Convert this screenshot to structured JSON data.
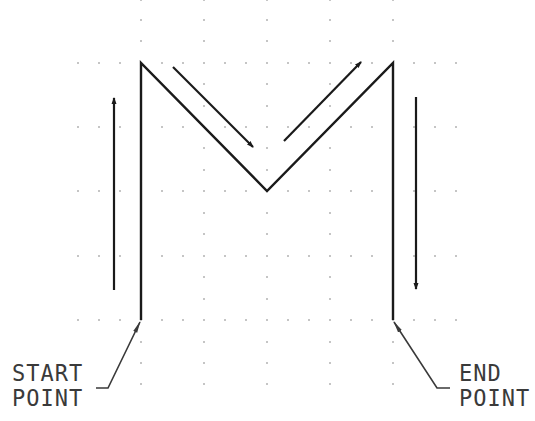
{
  "diagram": {
    "letter": "M",
    "colors": {
      "background": "#ffffff",
      "stroke": "#1a1a1a",
      "leader": "#3a3a3a",
      "grid_dot": "#8a8a8a"
    },
    "labels": {
      "start": {
        "line1": "START",
        "line2": "POINT"
      },
      "end": {
        "line1": "END",
        "line2": "POINT"
      }
    },
    "path": {
      "points": [
        [
          141,
          320
        ],
        [
          141,
          63
        ],
        [
          267,
          191
        ],
        [
          393,
          63
        ],
        [
          393,
          320
        ]
      ],
      "description": "Continuous M stroke from start point to end point"
    },
    "direction_arrows": [
      {
        "name": "up-arrow",
        "from": [
          114,
          290
        ],
        "to": [
          114,
          97
        ]
      },
      {
        "name": "diagonal-down-arrow",
        "from": [
          173,
          67
        ],
        "to": [
          254,
          148
        ]
      },
      {
        "name": "diagonal-up-arrow",
        "from": [
          284,
          141
        ],
        "to": [
          362,
          61
        ]
      },
      {
        "name": "down-arrow",
        "from": [
          416,
          97
        ],
        "to": [
          416,
          290
        ]
      }
    ],
    "grid": {
      "major_columns": [
        141,
        204,
        267,
        330,
        393
      ],
      "minor_columns": [
        78,
        99,
        120,
        141,
        162,
        183,
        204,
        225,
        246,
        267,
        288,
        309,
        330,
        351,
        372,
        393,
        414,
        435,
        456
      ],
      "major_rows": [
        63,
        127,
        191,
        256,
        320
      ],
      "intermediate_rows": [
        0,
        20,
        41,
        84,
        106,
        148,
        170,
        213,
        234,
        277,
        299,
        342,
        363,
        384
      ]
    }
  }
}
